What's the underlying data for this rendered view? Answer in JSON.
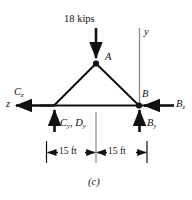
{
  "figure": {
    "caption": "(c)",
    "type": "free-body-diagram"
  },
  "load": {
    "label": "18 kips",
    "direction": "down"
  },
  "joints": {
    "apex": "A",
    "right": "B"
  },
  "axes": {
    "y": "y",
    "z": "z"
  },
  "reactions": {
    "cz": {
      "sym": "C",
      "sub": "z"
    },
    "cy_dy": {
      "sym1": "C",
      "sub1": "y",
      "sep": ",",
      "sym2": "D",
      "sub2": "y"
    },
    "bz": {
      "sym": "B",
      "sub": "z"
    },
    "by": {
      "sym": "B",
      "sub": "y"
    }
  },
  "dimensions": {
    "left": "15 ft",
    "right": "15 ft"
  },
  "colors": {
    "stroke": "#111111",
    "axis": "#8a8a8a",
    "background": "#ffffff"
  }
}
